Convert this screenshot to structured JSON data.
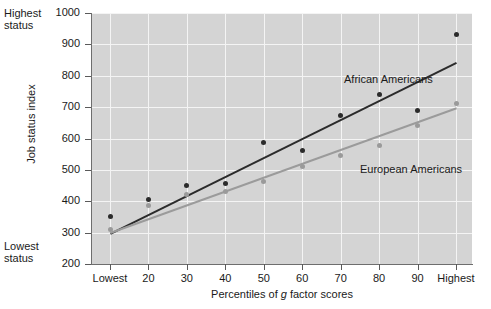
{
  "chart_data": {
    "type": "scatter",
    "title": "",
    "xlabel": "Percentiles of g factor scores",
    "ylabel": "Job status index",
    "categories": [
      "Lowest",
      "20",
      "30",
      "40",
      "50",
      "60",
      "70",
      "80",
      "90",
      "Highest"
    ],
    "ylim": [
      200,
      1000
    ],
    "yticks": [
      200,
      300,
      400,
      500,
      600,
      700,
      800,
      900,
      1000
    ],
    "grid": true,
    "legend_position": "inline-annotations",
    "annotations": [
      {
        "text": "Highest status",
        "position": "top-left-of-y-axis"
      },
      {
        "text": "Lowest status",
        "position": "bottom-left-of-y-axis"
      }
    ],
    "series": [
      {
        "name": "African Americans",
        "color": "#2b2b2b",
        "values": [
          352,
          405,
          450,
          455,
          587,
          562,
          672,
          740,
          690,
          930
        ],
        "trend": {
          "start": 300,
          "end": 845
        }
      },
      {
        "name": "European Americans",
        "color": "#9a9a9a",
        "values": [
          310,
          385,
          420,
          430,
          462,
          510,
          545,
          578,
          640,
          710
        ],
        "trend": {
          "start": 303,
          "end": 700
        }
      }
    ]
  },
  "axis": {
    "y_title": "Job status index",
    "x_title_prefix": "Percentiles of ",
    "x_title_italic": "g",
    "x_title_suffix": " factor scores",
    "y_tick_labels": [
      "1000",
      "900",
      "800",
      "700",
      "600",
      "500",
      "400",
      "300",
      "200"
    ],
    "x_tick_labels": [
      "Lowest",
      "20",
      "30",
      "40",
      "50",
      "60",
      "70",
      "80",
      "90",
      "Highest"
    ]
  },
  "notes": {
    "highest_status_line1": "Highest",
    "highest_status_line2": "status",
    "lowest_status_line1": "Lowest",
    "lowest_status_line2": "status"
  },
  "series_labels": {
    "african": "African Americans",
    "european": "European Americans"
  },
  "colors": {
    "plot_background": "#d4d4d4",
    "gridline": "#f4f4f4",
    "axis": "#6e6e6e",
    "african_americans": "#2b2b2b",
    "european_americans": "#9a9a9a",
    "text": "#1a1a1a"
  }
}
